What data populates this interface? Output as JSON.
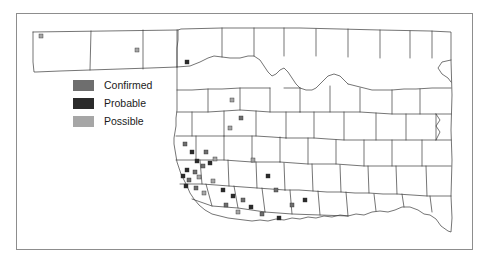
{
  "figure": {
    "kind": "county-distribution-map",
    "region": "Oklahoma",
    "background_color": "#ffffff",
    "frame_color": "#8d8d8d",
    "boundary_color": "#3a3a3a"
  },
  "legend": {
    "items": [
      {
        "label": "Confirmed",
        "color": "#6e6e6e",
        "swatch_name": "legend-swatch-confirmed"
      },
      {
        "label": "Probable",
        "color": "#2b2b2b",
        "swatch_name": "legend-swatch-probable"
      },
      {
        "label": "Possible",
        "color": "#a6a6a6",
        "swatch_name": "legend-swatch-possible"
      }
    ]
  },
  "chart_data": {
    "type": "map",
    "title": "",
    "xlabel": "",
    "ylabel": "",
    "categories": [
      "Confirmed",
      "Probable",
      "Possible"
    ],
    "counts": {
      "Confirmed": 12,
      "Probable": 14,
      "Possible": 9
    },
    "markers": [
      {
        "x": 41,
        "y": 36,
        "category": "Possible"
      },
      {
        "x": 137,
        "y": 50,
        "category": "Possible"
      },
      {
        "x": 187,
        "y": 62,
        "category": "Probable"
      },
      {
        "x": 232,
        "y": 100,
        "category": "Possible"
      },
      {
        "x": 241,
        "y": 118,
        "category": "Confirmed"
      },
      {
        "x": 230,
        "y": 128,
        "category": "Possible"
      },
      {
        "x": 185,
        "y": 144,
        "category": "Confirmed"
      },
      {
        "x": 192,
        "y": 152,
        "category": "Probable"
      },
      {
        "x": 206,
        "y": 152,
        "category": "Confirmed"
      },
      {
        "x": 215,
        "y": 159,
        "category": "Possible"
      },
      {
        "x": 197,
        "y": 161,
        "category": "Probable"
      },
      {
        "x": 210,
        "y": 163,
        "category": "Probable"
      },
      {
        "x": 203,
        "y": 166,
        "category": "Confirmed"
      },
      {
        "x": 187,
        "y": 170,
        "category": "Probable"
      },
      {
        "x": 195,
        "y": 172,
        "category": "Confirmed"
      },
      {
        "x": 183,
        "y": 176,
        "category": "Probable"
      },
      {
        "x": 199,
        "y": 177,
        "category": "Possible"
      },
      {
        "x": 189,
        "y": 180,
        "category": "Confirmed"
      },
      {
        "x": 213,
        "y": 181,
        "category": "Possible"
      },
      {
        "x": 186,
        "y": 186,
        "category": "Probable"
      },
      {
        "x": 196,
        "y": 188,
        "category": "Confirmed"
      },
      {
        "x": 223,
        "y": 190,
        "category": "Probable"
      },
      {
        "x": 204,
        "y": 193,
        "category": "Possible"
      },
      {
        "x": 233,
        "y": 196,
        "category": "Probable"
      },
      {
        "x": 243,
        "y": 200,
        "category": "Confirmed"
      },
      {
        "x": 226,
        "y": 205,
        "category": "Confirmed"
      },
      {
        "x": 251,
        "y": 207,
        "category": "Probable"
      },
      {
        "x": 238,
        "y": 212,
        "category": "Possible"
      },
      {
        "x": 262,
        "y": 214,
        "category": "Confirmed"
      },
      {
        "x": 279,
        "y": 218,
        "category": "Probable"
      },
      {
        "x": 292,
        "y": 205,
        "category": "Confirmed"
      },
      {
        "x": 305,
        "y": 200,
        "category": "Probable"
      },
      {
        "x": 253,
        "y": 160,
        "category": "Possible"
      },
      {
        "x": 268,
        "y": 176,
        "category": "Probable"
      },
      {
        "x": 276,
        "y": 190,
        "category": "Confirmed"
      }
    ],
    "grid": false,
    "legend_position": "upper-left"
  }
}
